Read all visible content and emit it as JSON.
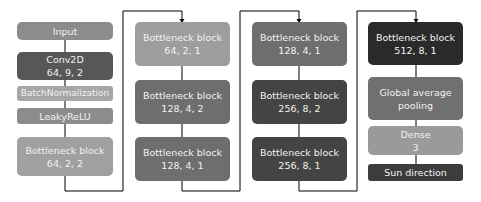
{
  "diagram": {
    "columns": [
      {
        "blocks": [
          {
            "line1": "Input",
            "line2": null,
            "color": "#8c8c8c"
          },
          {
            "line1": "Conv2D",
            "line2": "64, 9, 2",
            "color": "#575757"
          },
          {
            "line1": "BatchNormalization",
            "line2": null,
            "color": "#a6a6a6"
          },
          {
            "line1": "LeakyReLU",
            "line2": null,
            "color": "#8c8c8c"
          },
          {
            "line1": "Bottleneck block",
            "line2": "64, 2, 2",
            "color": "#a0a0a0"
          }
        ]
      },
      {
        "blocks": [
          {
            "line1": "Bottleneck block",
            "line2": "64, 2, 1",
            "color": "#9e9e9e"
          },
          {
            "line1": "Bottleneck block",
            "line2": "128, 4, 2",
            "color": "#6e6e6e"
          },
          {
            "line1": "Bottleneck block",
            "line2": "128, 4, 1",
            "color": "#6e6e6e"
          }
        ]
      },
      {
        "blocks": [
          {
            "line1": "Bottleneck block",
            "line2": "128, 4, 1",
            "color": "#6e6e6e"
          },
          {
            "line1": "Bottleneck block",
            "line2": "256, 8, 2",
            "color": "#444444"
          },
          {
            "line1": "Bottleneck block",
            "line2": "256, 8, 1",
            "color": "#444444"
          }
        ]
      },
      {
        "blocks": [
          {
            "line1": "Bottleneck block",
            "line2": "512, 8, 1",
            "color": "#2a2a2a"
          },
          {
            "line1": "Global average",
            "line2": "pooling",
            "color": "#707070"
          },
          {
            "line1": "Dense",
            "line2": "3",
            "color": "#9a9a9a"
          },
          {
            "line1": "Sun direction",
            "line2": null,
            "color": "#3c3c3c"
          }
        ]
      }
    ],
    "connector_color": "#000000"
  }
}
